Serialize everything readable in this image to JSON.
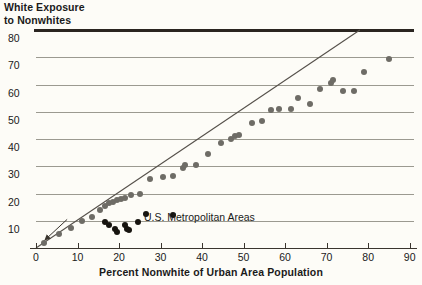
{
  "chart_data": {
    "type": "scatter",
    "title": "",
    "ylabel": "White Exposure\nto Nonwhites",
    "xlabel": "Percent Nonwhite of Urban Area Population",
    "xlim": [
      0,
      92
    ],
    "ylim": [
      0,
      80
    ],
    "xticks": [
      0,
      10,
      20,
      30,
      40,
      50,
      60,
      70,
      80,
      90
    ],
    "yticks": [
      10,
      20,
      30,
      40,
      50,
      60,
      70,
      80
    ],
    "grid": "horizontal",
    "legend": "none",
    "annotations": [
      {
        "text": "U.S. Metropolitan Areas",
        "x": 26,
        "y": 11,
        "arrow_from_x": 25.5,
        "arrow_from_y": 11.5,
        "arrow_to_x": 22.0,
        "arrow_to_y": 9.5
      }
    ],
    "reference_line": {
      "label": "equality line",
      "x0": 0,
      "y0": 0,
      "x1": 78,
      "y1": 80,
      "color": "#55504a"
    },
    "series": [
      {
        "name": "U.S. Metropolitan Areas (gray)",
        "color": "#6e6c66",
        "points": [
          [
            2.0,
            2.0
          ],
          [
            5.5,
            5.0
          ],
          [
            8.5,
            7.5
          ],
          [
            11.0,
            10.0
          ],
          [
            13.5,
            11.5
          ],
          [
            15.5,
            14.0
          ],
          [
            16.5,
            15.5
          ],
          [
            17.5,
            16.5
          ],
          [
            18.5,
            17.0
          ],
          [
            19.5,
            17.5
          ],
          [
            20.5,
            18.0
          ],
          [
            21.5,
            18.5
          ],
          [
            23.0,
            19.5
          ],
          [
            25.0,
            20.0
          ],
          [
            27.5,
            25.5
          ],
          [
            30.5,
            26.0
          ],
          [
            33.0,
            26.5
          ],
          [
            35.5,
            29.5
          ],
          [
            36.0,
            30.5
          ],
          [
            38.5,
            30.5
          ],
          [
            41.5,
            34.5
          ],
          [
            44.5,
            38.5
          ],
          [
            47.0,
            40.0
          ],
          [
            48.0,
            41.0
          ],
          [
            49.0,
            41.5
          ],
          [
            52.0,
            46.0
          ],
          [
            54.5,
            46.5
          ],
          [
            56.5,
            50.5
          ],
          [
            58.5,
            51.0
          ],
          [
            61.5,
            51.0
          ],
          [
            63.0,
            55.0
          ],
          [
            66.0,
            53.0
          ],
          [
            68.5,
            58.5
          ],
          [
            71.0,
            60.5
          ],
          [
            71.5,
            61.5
          ],
          [
            74.0,
            57.5
          ],
          [
            76.5,
            57.5
          ],
          [
            79.0,
            64.5
          ],
          [
            85.0,
            69.5
          ]
        ]
      },
      {
        "name": "Highlighted metros (black)",
        "color": "#17140f",
        "points": [
          [
            16.5,
            9.5
          ],
          [
            17.5,
            8.5
          ],
          [
            19.0,
            7.0
          ],
          [
            19.5,
            6.0
          ],
          [
            21.5,
            8.5
          ],
          [
            22.0,
            7.0
          ],
          [
            22.5,
            6.5
          ],
          [
            24.5,
            9.5
          ],
          [
            26.5,
            12.5
          ],
          [
            33.0,
            12.0
          ]
        ]
      }
    ]
  }
}
